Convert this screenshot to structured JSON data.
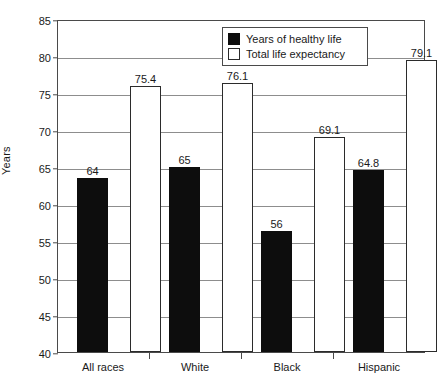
{
  "chart_data": {
    "type": "bar",
    "title": "",
    "xlabel": "",
    "ylabel": "Years",
    "ylim": [
      40,
      85
    ],
    "ytick_step": 5,
    "yticks": [
      "85",
      "80",
      "75",
      "70",
      "65",
      "60",
      "55",
      "50",
      "45",
      "40"
    ],
    "grid": true,
    "legend_position": "top-center-right",
    "categories": [
      "All races",
      "White",
      "Black",
      "Hispanic"
    ],
    "series": [
      {
        "name": "Years of healthy life",
        "color": "#0d0d0d",
        "values": [
          64,
          65,
          56,
          64.8
        ],
        "labels": [
          "64",
          "65",
          "56",
          "64.8"
        ],
        "plotted": [
          63.5,
          65.0,
          56.3,
          64.6
        ]
      },
      {
        "name": "Total life expectancy",
        "color": "#ffffff",
        "values": [
          75.4,
          76.1,
          69.1,
          79.1
        ],
        "labels": [
          "75.4",
          "76.1",
          "69.1",
          "79.1"
        ],
        "plotted": [
          75.9,
          76.4,
          69.0,
          79.5
        ]
      }
    ]
  },
  "legend": {
    "entries": [
      {
        "label": "Years of healthy life",
        "swatch": "dark"
      },
      {
        "label": "Total life expectancy",
        "swatch": "light"
      }
    ]
  },
  "axis": {
    "y_title": "Years"
  }
}
